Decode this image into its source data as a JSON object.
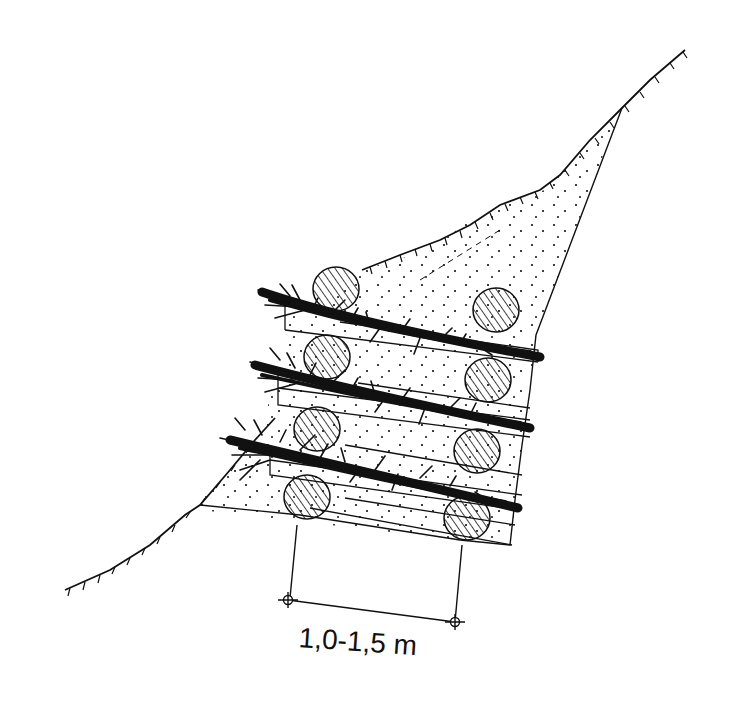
{
  "figure": {
    "type": "technical-section-drawing",
    "colors": {
      "ink": "#111111",
      "background": "#ffffff"
    }
  },
  "dimension": {
    "label": "1,0-1,5 m"
  },
  "elements": {
    "slope_line": "ground-surface",
    "fill_region": "stippled-soil-fill",
    "logs": 8,
    "brush_layers": 3,
    "tiers": 4
  }
}
